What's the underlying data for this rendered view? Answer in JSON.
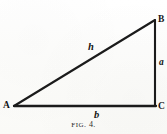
{
  "figure": {
    "caption_prefix": "Fig",
    "caption_suffix": ". 4.",
    "caption_full": "FIG. 4.",
    "background_color": "#fdfdfc",
    "ink_color": "#1b1b1b"
  },
  "diagram": {
    "type": "right-triangle",
    "vertices": [
      {
        "id": "A",
        "label": "A",
        "x": 14,
        "y": 106,
        "position": "bottom-left"
      },
      {
        "id": "B",
        "label": "B",
        "x": 155,
        "y": 20,
        "position": "top-right"
      },
      {
        "id": "C",
        "label": "C",
        "x": 155,
        "y": 106,
        "position": "bottom-right"
      }
    ],
    "sides": [
      {
        "id": "hypotenuse",
        "label": "h",
        "from": "A",
        "to": "B"
      },
      {
        "id": "vertical",
        "label": "a",
        "from": "B",
        "to": "C"
      },
      {
        "id": "base",
        "label": "b",
        "from": "A",
        "to": "C"
      }
    ],
    "right_angle_at": "C"
  }
}
